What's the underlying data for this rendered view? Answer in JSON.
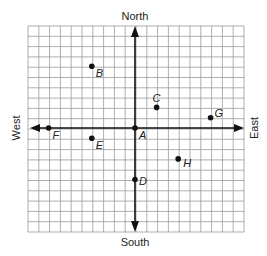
{
  "diagram": {
    "directions": {
      "north": "North",
      "south": "South",
      "east": "East",
      "west": "West"
    },
    "grid": {
      "columns": 20,
      "rows": 20,
      "x_range": [
        -10,
        10
      ],
      "y_range": [
        -10,
        10
      ],
      "line_color": "#9a9a9a",
      "axis_color": "#111111"
    },
    "points": [
      {
        "name": "A",
        "x": 0,
        "y": 0
      },
      {
        "name": "B",
        "x": -4,
        "y": 6
      },
      {
        "name": "C",
        "x": 2,
        "y": 2
      },
      {
        "name": "D",
        "x": 0,
        "y": -5
      },
      {
        "name": "E",
        "x": -4,
        "y": -1
      },
      {
        "name": "F",
        "x": -8,
        "y": 0
      },
      {
        "name": "G",
        "x": 7,
        "y": 1
      },
      {
        "name": "H",
        "x": 4,
        "y": -3
      }
    ]
  }
}
